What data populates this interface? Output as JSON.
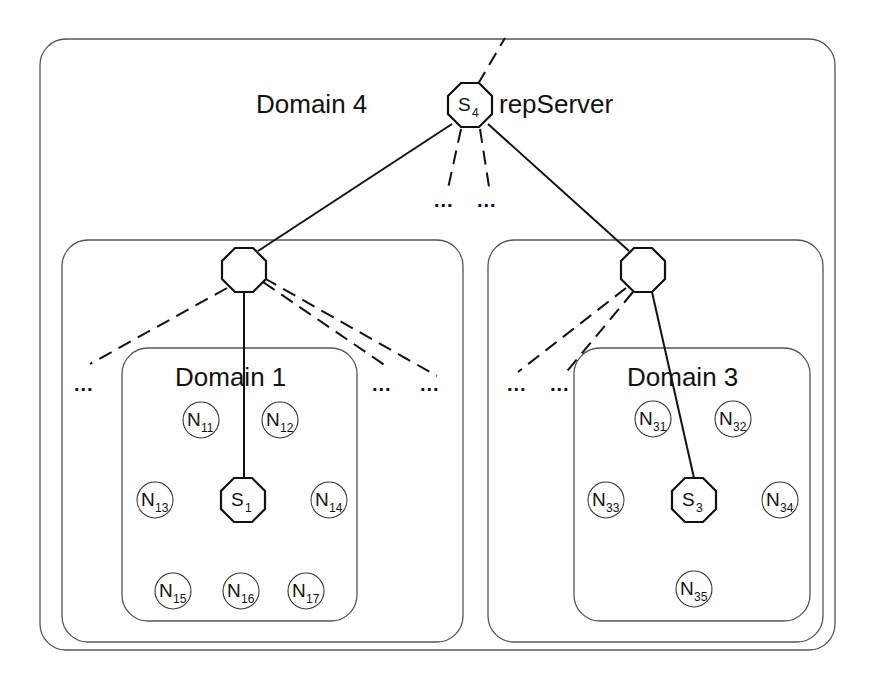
{
  "diagram": {
    "outer_domain": {
      "label": "Domain 4",
      "server": {
        "symbol": "S",
        "subscript": "4",
        "role_label": "repServer"
      },
      "ellipsis_children": [
        "...",
        "..."
      ]
    },
    "left_subdomain": {
      "ellipsis_left": "...",
      "ellipsis_right": [
        "...",
        "..."
      ],
      "inner_domain": {
        "label": "Domain 1",
        "server": {
          "symbol": "S",
          "subscript": "1"
        },
        "nodes": [
          {
            "symbol": "N",
            "subscript": "11"
          },
          {
            "symbol": "N",
            "subscript": "12"
          },
          {
            "symbol": "N",
            "subscript": "13"
          },
          {
            "symbol": "N",
            "subscript": "14"
          },
          {
            "symbol": "N",
            "subscript": "15"
          },
          {
            "symbol": "N",
            "subscript": "16"
          },
          {
            "symbol": "N",
            "subscript": "17"
          }
        ]
      }
    },
    "right_subdomain": {
      "ellipsis_left": [
        "...",
        "..."
      ],
      "inner_domain": {
        "label": "Domain 3",
        "server": {
          "symbol": "S",
          "subscript": "3"
        },
        "nodes": [
          {
            "symbol": "N",
            "subscript": "31"
          },
          {
            "symbol": "N",
            "subscript": "32"
          },
          {
            "symbol": "N",
            "subscript": "33"
          },
          {
            "symbol": "N",
            "subscript": "34"
          },
          {
            "symbol": "N",
            "subscript": "35"
          }
        ]
      }
    },
    "colors": {
      "stroke": "#111111",
      "box": "#555555",
      "background": "#ffffff"
    }
  }
}
